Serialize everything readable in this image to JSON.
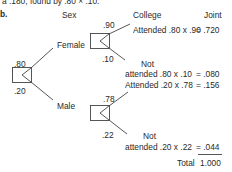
{
  "top_line": "a  .180, found by .80 × .10.",
  "part_label": "b.",
  "headers": {
    "sex": "Sex",
    "college": "College",
    "joint": "Joint"
  },
  "root": {
    "prob_female": ".80",
    "prob_male": ".20"
  },
  "female": {
    "label": "Female",
    "prob_attended": ".90",
    "prob_not": ".10",
    "attended_line": "Attended .80 x .90",
    "attended_joint": "= .720",
    "not_word": "Not",
    "not_line": "attended .80 x .10",
    "not_joint": "= .080"
  },
  "male": {
    "label": "Male",
    "prob_attended": ".78",
    "prob_not": ".22",
    "attended_line": "Attended .20 x .78",
    "attended_joint": "= .156",
    "not_word": "Not",
    "not_line": "attended .20 x .22",
    "not_joint": "= .044"
  },
  "total": {
    "label": "Total",
    "value": "1.000"
  }
}
